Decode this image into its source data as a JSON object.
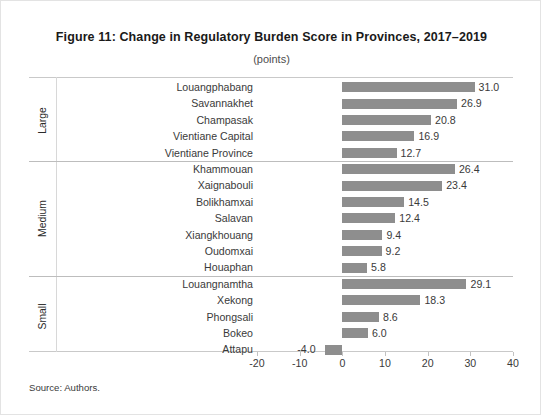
{
  "figure": {
    "title": "Figure 11: Change in Regulatory Burden Score in Provinces, 2017–2019",
    "subtitle": "(points)",
    "source": "Source: Authors."
  },
  "chart_data": {
    "type": "bar",
    "orientation": "horizontal",
    "title": "Figure 11: Change in Regulatory Burden Score in Provinces, 2017–2019",
    "subtitle": "(points)",
    "xlabel": "",
    "ylabel": "",
    "unit": "points",
    "xlim": [
      -20,
      40
    ],
    "xticks": [
      -20,
      -10,
      0,
      10,
      20,
      30,
      40
    ],
    "xtick_labels": [
      "-20",
      "-10",
      "0",
      "10",
      "20",
      "30",
      "40"
    ],
    "grid": false,
    "legend": "none",
    "bar_color": "#8e8e8e",
    "groups": [
      {
        "name": "Large",
        "categories": [
          "Louangphabang",
          "Savannakhet",
          "Champasak",
          "Vientiane Capital",
          "Vientiane Province"
        ],
        "values": [
          31.0,
          26.9,
          20.8,
          16.9,
          12.7
        ],
        "value_labels": [
          "31.0",
          "26.9",
          "20.8",
          "16.9",
          "12.7"
        ]
      },
      {
        "name": "Medium",
        "categories": [
          "Khammouan",
          "Xaignabouli",
          "Bolikhamxai",
          "Salavan",
          "Xiangkhouang",
          "Oudomxai",
          "Houaphan"
        ],
        "values": [
          26.4,
          23.4,
          14.5,
          12.4,
          9.4,
          9.2,
          5.8
        ],
        "value_labels": [
          "26.4",
          "23.4",
          "14.5",
          "12.4",
          "9.4",
          "9.2",
          "5.8"
        ]
      },
      {
        "name": "Small",
        "categories": [
          "Louangnamtha",
          "Xekong",
          "Phongsali",
          "Bokeo",
          "Attapu"
        ],
        "values": [
          29.1,
          18.3,
          8.6,
          6.0,
          -4.0
        ],
        "value_labels": [
          "29.1",
          "18.3",
          "8.6",
          "6.0",
          "-4.0"
        ]
      }
    ]
  }
}
